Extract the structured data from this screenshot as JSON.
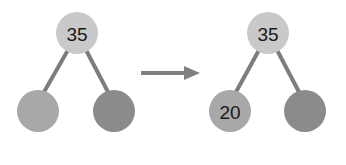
{
  "diagram": {
    "type": "binary-tree-insertion",
    "colors": {
      "root": "#c9c9c9",
      "left_child": "#a8a8a8",
      "right_child": "#8b8b8b",
      "edge": "#7d7d7d",
      "arrow": "#808080",
      "text": "#1a1a1a"
    },
    "before": {
      "root": {
        "label": "35"
      },
      "left_child": {
        "label": ""
      },
      "right_child": {
        "label": ""
      }
    },
    "arrow": {
      "direction": "right"
    },
    "after": {
      "root": {
        "label": "35"
      },
      "left_child": {
        "label": "20"
      },
      "right_child": {
        "label": ""
      }
    }
  }
}
